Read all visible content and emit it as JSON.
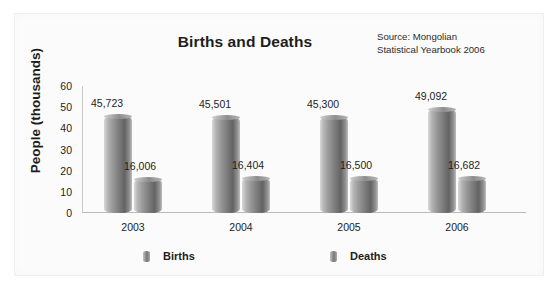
{
  "chart_data": {
    "type": "bar",
    "title": "Births and Deaths",
    "xlabel": "",
    "ylabel": "People (thousands)",
    "ylim": [
      0,
      60
    ],
    "yticks": [
      60,
      50,
      40,
      30,
      20,
      10,
      0
    ],
    "grid": false,
    "legend_position": "bottom",
    "categories": [
      "2003",
      "2004",
      "2005",
      "2006"
    ],
    "series": [
      {
        "name": "Births",
        "values": [
          45723,
          45501,
          45300,
          49092
        ],
        "labels": [
          "45,723",
          "45,501",
          "45,300",
          "49,092"
        ]
      },
      {
        "name": "Deaths",
        "values": [
          16006,
          16404,
          16500,
          16682
        ],
        "labels": [
          "16,006",
          "16,404",
          "16,500",
          "16,682"
        ]
      }
    ],
    "annotations": {
      "source_line1": "Source: Mongolian",
      "source_line2": "Statistical Yearbook 2006"
    },
    "colors": {
      "bar_light": "#d8d8d8",
      "bar_dark": "#636363",
      "axis": "#b9b9b9",
      "text": "#1d1d1d",
      "background": "#fbfbfb"
    }
  }
}
